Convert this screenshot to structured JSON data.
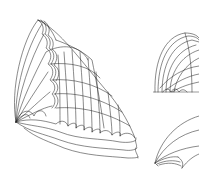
{
  "figure": {
    "stroke_color": "#2a2a2a",
    "background": "#ffffff",
    "panels": [
      {
        "name": "main-shell-sketch",
        "label": ""
      },
      {
        "name": "top-right-vault-sketch",
        "label": ""
      },
      {
        "name": "bottom-right-shell-sketch",
        "label": ""
      }
    ]
  }
}
